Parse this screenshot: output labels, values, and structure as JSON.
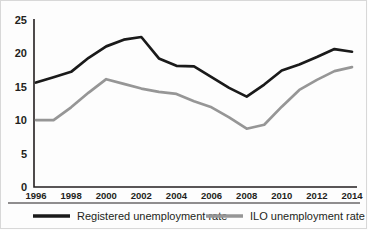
{
  "chart_data": {
    "type": "line",
    "title": "",
    "subtitle": "",
    "xlabel": "",
    "ylabel": "",
    "grid": false,
    "legend_position": "bottom",
    "xlim": [
      1996,
      2014
    ],
    "ylim": [
      0,
      25
    ],
    "yticks": [
      0,
      5,
      10,
      15,
      20,
      25
    ],
    "ytick_labels": [
      "0",
      "5",
      "10",
      "15",
      "20",
      "25"
    ],
    "xticks": [
      1996,
      1998,
      2000,
      2002,
      2004,
      2006,
      2008,
      2010,
      2012,
      2014
    ],
    "xtick_labels": [
      "1996",
      "1998",
      "2000",
      "2002",
      "2004",
      "2006",
      "2008",
      "2010",
      "2012",
      "2014"
    ],
    "x": [
      1996,
      1997,
      1998,
      1999,
      2000,
      2001,
      2002,
      2003,
      2004,
      2005,
      2006,
      2007,
      2008,
      2009,
      2010,
      2011,
      2012,
      2013,
      2014
    ],
    "series": [
      {
        "name": "Registered unemployment rate",
        "color": "#1a1a1a",
        "values": [
          15.6,
          16.4,
          17.2,
          19.3,
          21.0,
          22.0,
          22.4,
          19.2,
          18.1,
          18.0,
          16.4,
          14.8,
          13.5,
          15.3,
          17.4,
          18.3,
          19.4,
          20.6,
          20.2
        ]
      },
      {
        "name": "ILO unemployment rate",
        "color": "#969696",
        "values": [
          10.0,
          10.0,
          11.9,
          14.1,
          16.1,
          15.4,
          14.7,
          14.2,
          13.9,
          12.8,
          11.9,
          10.4,
          8.7,
          9.3,
          12.0,
          14.5,
          16.0,
          17.3,
          17.9
        ]
      }
    ],
    "legend": [
      {
        "label": "Registered unemployment rate",
        "color": "#1a1a1a"
      },
      {
        "label": "ILO unemployment rate",
        "color": "#969696"
      }
    ]
  }
}
